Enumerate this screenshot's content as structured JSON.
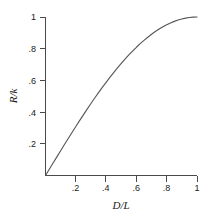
{
  "chart_data": {
    "type": "line",
    "title": "",
    "xlabel": "D/L",
    "ylabel": "R/k",
    "xlim": [
      0,
      1
    ],
    "ylim": [
      0,
      1
    ],
    "grid": false,
    "legend": "none",
    "xticks": [
      0.2,
      0.4,
      0.6,
      0.8,
      1
    ],
    "xtick_labels": [
      ".2",
      ".4",
      ".6",
      ".8",
      "1"
    ],
    "yticks": [
      0.2,
      0.4,
      0.6,
      0.8,
      1
    ],
    "ytick_labels": [
      ".2",
      ".4",
      ".6",
      ".8",
      "1"
    ],
    "series": [
      {
        "name": "R/k vs D/L",
        "x": [
          0,
          0.025,
          0.05,
          0.075,
          0.1,
          0.125,
          0.15,
          0.175,
          0.2,
          0.225,
          0.25,
          0.275,
          0.3,
          0.325,
          0.35,
          0.375,
          0.4,
          0.425,
          0.45,
          0.475,
          0.5,
          0.525,
          0.55,
          0.575,
          0.6,
          0.625,
          0.65,
          0.675,
          0.7,
          0.725,
          0.75,
          0.775,
          0.8,
          0.825,
          0.85,
          0.875,
          0.9,
          0.925,
          0.95,
          0.975,
          1
        ],
        "y": [
          0,
          0.0392,
          0.0785,
          0.1175,
          0.1564,
          0.1951,
          0.2334,
          0.2714,
          0.309,
          0.3461,
          0.3827,
          0.4187,
          0.454,
          0.4886,
          0.5225,
          0.5556,
          0.5878,
          0.6191,
          0.6494,
          0.6788,
          0.7071,
          0.7343,
          0.7604,
          0.7853,
          0.809,
          0.8315,
          0.8526,
          0.8725,
          0.891,
          0.9081,
          0.9239,
          0.9382,
          0.9511,
          0.9625,
          0.9724,
          0.9808,
          0.9877,
          0.993,
          0.9969,
          0.9992,
          1
        ]
      }
    ],
    "curve_color": "#555555",
    "axis_color": "#4a4a4a",
    "background_color": "#ffffff"
  },
  "axes": {
    "y_title": "R/k",
    "x_title": "D/L"
  }
}
